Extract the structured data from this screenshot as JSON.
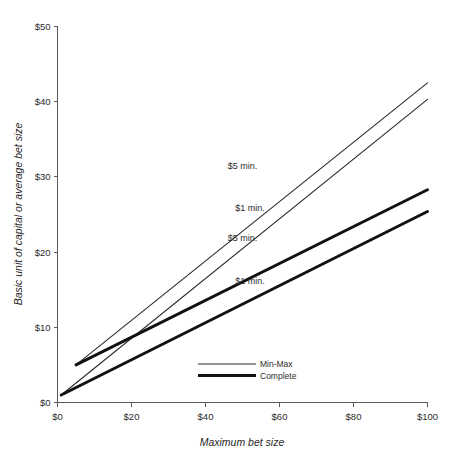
{
  "figure": {
    "background_color": "#ffffff",
    "line_color_thin": "#2a2a2a",
    "line_color_thick": "#111111",
    "axis_color": "#5a5a5a"
  },
  "chart_data": {
    "type": "line",
    "title": "",
    "xlabel": "Maximum bet size",
    "ylabel": "Basic unit of capital or average bet size",
    "xlim": [
      0,
      100
    ],
    "ylim": [
      0,
      50
    ],
    "grid": false,
    "legend_position": "inside-bottom-center",
    "xticks": [
      0,
      20,
      40,
      60,
      80,
      100
    ],
    "xtick_labels": [
      "$0",
      "$20",
      "$40",
      "$60",
      "$80",
      "$100"
    ],
    "yticks": [
      0,
      10,
      20,
      30,
      40,
      50
    ],
    "ytick_labels": [
      "$0",
      "$10",
      "$20",
      "$30",
      "$40",
      "$50"
    ],
    "series": [
      {
        "name": "Min-Max $5 min.",
        "group": "Min-Max",
        "style": "thin",
        "annotation": "$5 min.",
        "x": [
          5,
          100
        ],
        "y": [
          5.0,
          42.5
        ]
      },
      {
        "name": "Min-Max $1 min.",
        "group": "Min-Max",
        "style": "thin",
        "annotation": "$1 min.",
        "x": [
          1,
          100
        ],
        "y": [
          1.0,
          40.3
        ]
      },
      {
        "name": "Complete $5 min.",
        "group": "Complete",
        "style": "thick",
        "annotation": "$5 min.",
        "x": [
          5,
          100
        ],
        "y": [
          5.0,
          28.3
        ]
      },
      {
        "name": "Complete $1 min.",
        "group": "Complete",
        "style": "thick",
        "annotation": "$1 min.",
        "x": [
          1,
          100
        ],
        "y": [
          1.0,
          25.4
        ]
      }
    ],
    "legend_entries": [
      {
        "label": "Min-Max",
        "style": "thin"
      },
      {
        "label": "Complete",
        "style": "thick"
      }
    ],
    "annotations": [
      {
        "text": "$5 min.",
        "x": 50,
        "y": 31.0,
        "series": "Min-Max $5 min."
      },
      {
        "text": "$1 min.",
        "x": 52,
        "y": 25.5,
        "series": "Min-Max $1 min."
      },
      {
        "text": "$5 min.",
        "x": 50,
        "y": 21.5,
        "series": "Complete $5 min."
      },
      {
        "text": "$1 min.",
        "x": 52,
        "y": 15.8,
        "series": "Complete $1 min."
      }
    ]
  }
}
